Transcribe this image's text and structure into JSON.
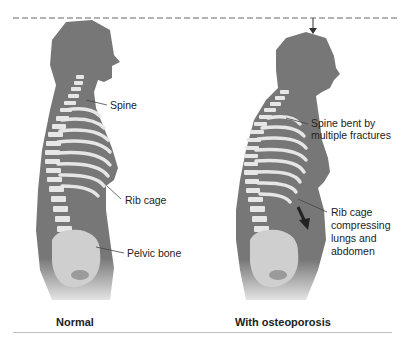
{
  "figure": {
    "reference_line": "dashed",
    "colors": {
      "body": "#777777",
      "bone": "#e6e6e6",
      "line": "#555555",
      "text": "#222222"
    }
  },
  "panels": [
    {
      "caption": "Normal",
      "labels": {
        "spine": "Spine",
        "rib_cage": "Rib cage",
        "pelvic_bone": "Pelvic bone"
      }
    },
    {
      "caption": "With osteoporosis",
      "labels": {
        "spine_line1": "Spine bent by",
        "spine_line2": "multiple fractures",
        "rib_line1": "Rib cage",
        "rib_line2": "compressing",
        "rib_line3": "lungs and",
        "rib_line4": "abdomen"
      }
    }
  ]
}
